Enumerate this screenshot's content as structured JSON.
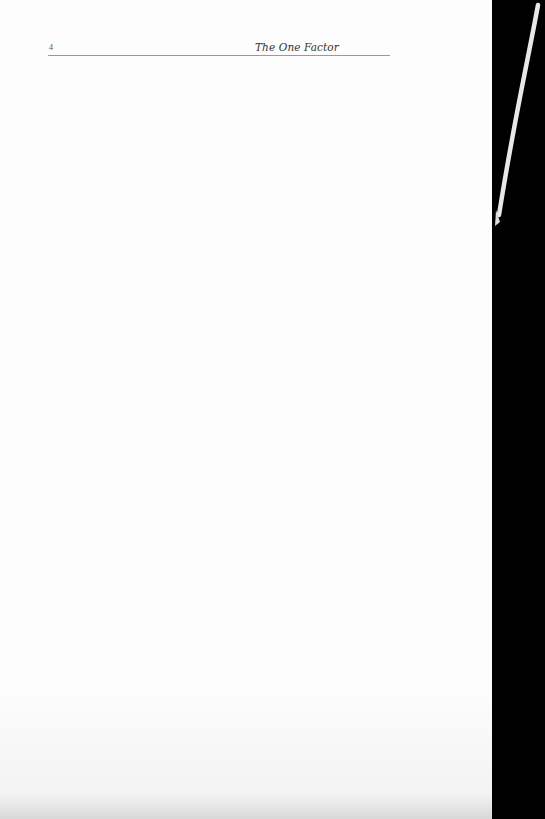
{
  "page": {
    "number": "4",
    "running_title": "The One Factor"
  },
  "colors": {
    "paper": "#fdfdfd",
    "background": "#000000",
    "rule": "#9a9a9a"
  }
}
